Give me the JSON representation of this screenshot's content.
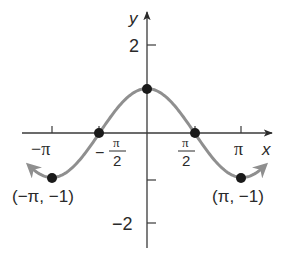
{
  "chart_data": {
    "type": "line",
    "title": "",
    "function": "y = cos(x)",
    "xlabel": "x",
    "ylabel": "y",
    "xlim": [
      -3.9,
      4.1
    ],
    "ylim": [
      -2.4,
      2.7
    ],
    "grid": false,
    "legend": null,
    "x_ticks": [
      {
        "value": -3.14159,
        "label": "−π"
      },
      {
        "value": -1.5708,
        "label_num": "π",
        "label_den": "2",
        "sign": "−"
      },
      {
        "value": 1.5708,
        "label_num": "π",
        "label_den": "2",
        "sign": ""
      },
      {
        "value": 3.14159,
        "label": "π"
      }
    ],
    "y_ticks": [
      {
        "value": 2,
        "label": "2"
      },
      {
        "value": -1,
        "label": ""
      },
      {
        "value": -2,
        "label": "−2"
      }
    ],
    "series": [
      {
        "name": "cos x",
        "color": "#8f8f8f",
        "x_range": [
          -3.85,
          3.85
        ],
        "arrows": "both",
        "points": [
          {
            "x": -3.14159,
            "y": -1
          },
          {
            "x": -1.5708,
            "y": 0
          },
          {
            "x": 0,
            "y": 1
          },
          {
            "x": 1.5708,
            "y": 0
          },
          {
            "x": 3.14159,
            "y": -1
          }
        ]
      }
    ],
    "annotations": [
      {
        "x": -3.14159,
        "y": -1,
        "text": "(−π, −1)"
      },
      {
        "x": 3.14159,
        "y": -1,
        "text": "(π, −1)"
      }
    ]
  },
  "labels": {
    "x_axis": "x",
    "y_axis": "y",
    "y_tick_2": "2",
    "y_tick_neg2": "−2",
    "x_tick_neg_pi": "−π",
    "x_tick_pi": "π",
    "pi": "π",
    "two": "2",
    "minus": "−",
    "point_left": "(−π, −1)",
    "point_right": "(π, −1)"
  },
  "colors": {
    "curve": "#8f8f8f",
    "axis": "#3a3a3a",
    "point": "#1a1a1a"
  }
}
